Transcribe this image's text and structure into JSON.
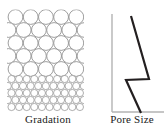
{
  "figure": {
    "title": "",
    "width": 168,
    "height": 135,
    "background_color": "#ffffff"
  },
  "panels": {
    "gradation": {
      "caption": "Gradation",
      "description": "packed circles representing soil grains, coarse above and fine below",
      "outline_color": "#8c8c8c",
      "fill_color": "#ffffff",
      "coarse_grain_diameter_px": 15,
      "fine_grain_diameter_px": 7.2,
      "boundary_y_px": 74
    },
    "pore_size": {
      "caption": "Pore Size",
      "axis_color": "#b3b3b3",
      "line_color": "#231f20",
      "line_width_px": 2.2
    }
  },
  "chart_data": {
    "type": "line",
    "title": "Pore Size",
    "xlabel": "Pore Size",
    "ylabel": "",
    "grid": false,
    "legend": null,
    "axis": {
      "vertical_axis_x": 16,
      "vertical_axis_top_y": 14,
      "vertical_axis_bottom_y": 112,
      "horizontal_axis_y": 112,
      "horizontal_axis_left_x": 16,
      "horizontal_axis_right_x": 68
    },
    "series": [
      {
        "name": "Pore Size profile",
        "points": [
          [
            35,
            16
          ],
          [
            53,
            79
          ],
          [
            30,
            80
          ],
          [
            45,
            113
          ]
        ]
      }
    ],
    "annotations": [
      "step discontinuity at gradation boundary"
    ]
  },
  "grain_pattern": {
    "coarse_rows": [
      {
        "cy": 17,
        "cx_start": 15.5,
        "count": 5,
        "spacing": 15.2,
        "r": 7.4
      },
      {
        "cy": 30,
        "cx_start": 8.5,
        "count": 6,
        "spacing": 15.2,
        "r": 7.4
      },
      {
        "cy": 43,
        "cx_start": 15.5,
        "count": 5,
        "spacing": 15.2,
        "r": 7.4
      },
      {
        "cy": 56,
        "cx_start": 8.5,
        "count": 6,
        "spacing": 15.2,
        "r": 7.4
      },
      {
        "cy": 69,
        "cx_start": 15.5,
        "count": 5,
        "spacing": 15.2,
        "r": 7.4
      }
    ],
    "fine_rows": [
      {
        "cy": 79,
        "cx_start": 11.5,
        "count": 10,
        "spacing": 7.6,
        "r": 3.6
      },
      {
        "cy": 86,
        "cx_start": 7.8,
        "count": 11,
        "spacing": 7.6,
        "r": 3.6
      },
      {
        "cy": 93,
        "cx_start": 11.5,
        "count": 10,
        "spacing": 7.6,
        "r": 3.6
      },
      {
        "cy": 100,
        "cx_start": 7.8,
        "count": 11,
        "spacing": 7.6,
        "r": 3.6
      },
      {
        "cy": 107,
        "cx_start": 11.5,
        "count": 10,
        "spacing": 7.6,
        "r": 3.6
      }
    ]
  }
}
